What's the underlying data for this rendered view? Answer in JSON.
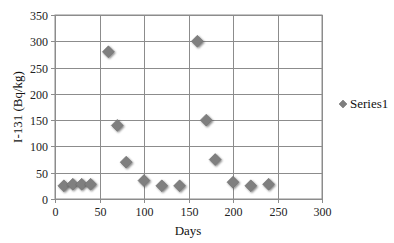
{
  "chart_data": {
    "type": "scatter",
    "title": "",
    "xlabel": "Days",
    "ylabel": "I-131 (Bq/kg)",
    "xlim": [
      0,
      300
    ],
    "ylim": [
      0,
      350
    ],
    "xticks": [
      0,
      50,
      100,
      150,
      200,
      250,
      300
    ],
    "yticks": [
      0,
      50,
      100,
      150,
      200,
      250,
      300,
      350
    ],
    "grid": true,
    "legend": {
      "placement": "right",
      "entries": [
        "Series1"
      ]
    },
    "marker": "diamond",
    "series": [
      {
        "name": "Series1",
        "color": "#7f7f7f",
        "x": [
          10,
          20,
          30,
          40,
          60,
          70,
          80,
          100,
          120,
          140,
          160,
          170,
          180,
          200,
          220,
          240
        ],
        "y": [
          25,
          28,
          28,
          28,
          280,
          140,
          70,
          35,
          25,
          25,
          300,
          150,
          75,
          32,
          25,
          28
        ]
      }
    ]
  }
}
